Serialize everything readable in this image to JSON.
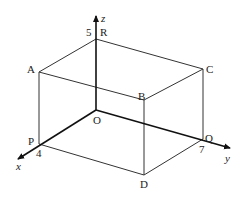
{
  "diagram": {
    "type": "3d-cuboid-axes",
    "colors": {
      "stroke": "#333333",
      "axis": "#111111",
      "background": "#ffffff"
    },
    "axes": {
      "x": {
        "label": "x",
        "tick_label": "4"
      },
      "y": {
        "label": "y",
        "tick_label": "7"
      },
      "z": {
        "label": "z",
        "tick_label": "5"
      }
    },
    "vertices": {
      "O": "O",
      "P": "P",
      "Q": "Q",
      "R": "R",
      "A": "A",
      "B": "B",
      "C": "C",
      "D": "D"
    },
    "dimensions": {
      "x": 4,
      "y": 7,
      "z": 5
    }
  }
}
